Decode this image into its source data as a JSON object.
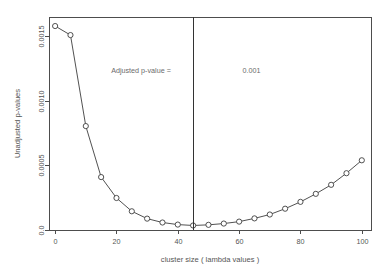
{
  "chart_data": {
    "type": "line",
    "title": "",
    "xlabel": "cluster size ( lambda values )",
    "ylabel": "Unadjusted p-values",
    "xlim": [
      -2,
      103
    ],
    "ylim": [
      0,
      0.00165
    ],
    "grid": false,
    "legend": "none",
    "marker": "open-circle",
    "x": [
      0,
      5,
      10,
      15,
      20,
      25,
      30,
      35,
      40,
      45,
      50,
      55,
      60,
      65,
      70,
      75,
      80,
      85,
      90,
      95,
      100
    ],
    "xtick_labels": [
      "0",
      "20",
      "40",
      "60",
      "80",
      "100"
    ],
    "xtick_values": [
      0,
      20,
      40,
      60,
      80,
      100
    ],
    "ytick_labels": [
      "0.0",
      "0.0005",
      "0.0010",
      "0.0015"
    ],
    "ytick_values": [
      0,
      0.0005,
      0.001,
      0.0015
    ],
    "series": [
      {
        "name": "Unadjusted p-values",
        "values": [
          0.00158,
          0.00151,
          0.000805,
          0.00041,
          0.000248,
          0.000145,
          8.8e-05,
          5.8e-05,
          4.2e-05,
          3.5e-05,
          4e-05,
          5e-05,
          6.5e-05,
          9e-05,
          0.00012,
          0.000165,
          0.000218,
          0.00028,
          0.00035,
          0.00044,
          0.00054
        ]
      }
    ],
    "annotations": [
      {
        "name": "adjusted-p-value-label",
        "text": "Adjusted p-value =",
        "x": 28,
        "y": 0.00122
      },
      {
        "name": "adjusted-p-value-number",
        "text": "0.001",
        "x": 64,
        "y": 0.00122
      },
      {
        "name": "threshold-line",
        "text": "",
        "x": 45,
        "y": 0
      }
    ],
    "vertical_line_x": 45,
    "colors": {
      "line": "#3d3d3d",
      "marker_fill": "#ffffff",
      "axis": "#4d4d4d",
      "text": "#555555",
      "annotation": "#6b6b6b",
      "background": "#ffffff"
    }
  }
}
